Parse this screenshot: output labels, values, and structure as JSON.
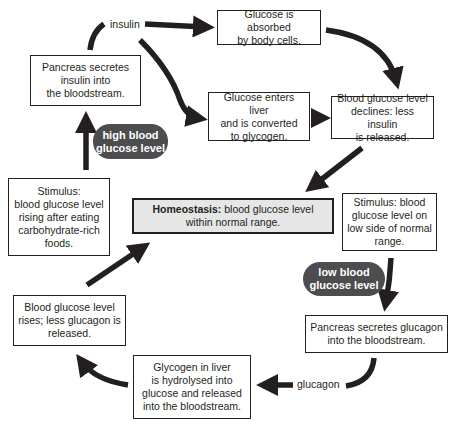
{
  "diagram": {
    "type": "feedback-loop",
    "colors": {
      "stroke": "#231f20",
      "pill_fill": "#4d4d4f",
      "homeostasis_fill": "#e6e6e6"
    },
    "center": {
      "bold_label": "Homeostasis:",
      "line1": " blood glucose level",
      "line2": "within normal range."
    },
    "high_branch": {
      "pill": {
        "line1": "high blood",
        "line2": "glucose level"
      },
      "stimulus": {
        "lines": [
          "Stimulus:",
          "blood glucose level",
          "rising after eating",
          "carbohydrate-rich",
          "foods."
        ]
      },
      "pancreas": {
        "lines": [
          "Pancreas secretes",
          "insulin into",
          "the bloodstream."
        ]
      },
      "hormone_label": "insulin",
      "absorbed": {
        "lines": [
          "Glucose is absorbed",
          "by body cells."
        ]
      },
      "liver": {
        "lines": [
          "Glucose enters liver",
          "and is converted",
          "to glycogen."
        ]
      },
      "declines": {
        "lines": [
          "Blood glucose level",
          "declines: less insulin",
          "is released."
        ]
      }
    },
    "low_branch": {
      "stimulus": {
        "lines": [
          "Stimulus: blood",
          "glucose level on",
          "low side of normal",
          "range."
        ]
      },
      "pill": {
        "line1": "low blood",
        "line2": "glucose level"
      },
      "pancreas": {
        "lines": [
          "Pancreas secretes glucagon",
          "into the bloodstream."
        ]
      },
      "hormone_label": "glucagon",
      "liver": {
        "lines": [
          "Glycogen in liver",
          "is hydrolysed into",
          "glucose and released",
          "into the bloodstream."
        ]
      },
      "rises": {
        "lines": [
          "Blood glucose level",
          "rises; less glucagon is",
          "released."
        ]
      }
    }
  }
}
